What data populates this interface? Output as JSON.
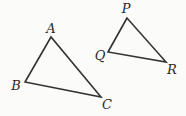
{
  "diagram": {
    "stroke_color": "#333333",
    "label_color": "#2a2a2a",
    "background": "#fbfbfa",
    "triangles": [
      {
        "name": "ABC",
        "vertices": [
          {
            "label": "A",
            "x": 51,
            "y": 37,
            "lx": 51,
            "ly": 33
          },
          {
            "label": "B",
            "x": 25,
            "y": 82,
            "lx": 16,
            "ly": 90
          },
          {
            "label": "C",
            "x": 101,
            "y": 97,
            "lx": 107,
            "ly": 109
          }
        ]
      },
      {
        "name": "PQR",
        "vertices": [
          {
            "label": "P",
            "x": 127,
            "y": 18,
            "lx": 126,
            "ly": 13
          },
          {
            "label": "Q",
            "x": 108,
            "y": 52,
            "lx": 100,
            "ly": 60
          },
          {
            "label": "R",
            "x": 166,
            "y": 62,
            "lx": 172,
            "ly": 74
          }
        ]
      }
    ]
  }
}
